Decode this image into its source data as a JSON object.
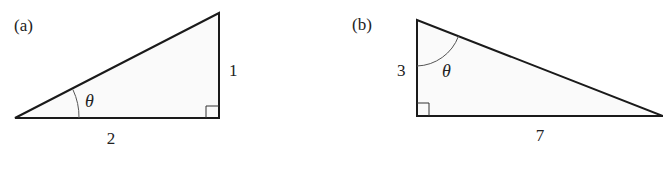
{
  "figures": [
    {
      "id": "a",
      "panel_label": "(a)",
      "angle_label": "θ",
      "base_label": "2",
      "height_label": "1",
      "description": "Right triangle with legs 2 (horizontal) and 1 (vertical); angle θ at the left vertex"
    },
    {
      "id": "b",
      "panel_label": "(b)",
      "angle_label": "θ",
      "base_label": "7",
      "height_label": "3",
      "description": "Right triangle with legs 3 (vertical) and 7 (horizontal); angle θ at the top vertex"
    }
  ],
  "colors": {
    "stroke": "#1a1a1a",
    "fill": "#fafafa",
    "arc": "#555555"
  }
}
